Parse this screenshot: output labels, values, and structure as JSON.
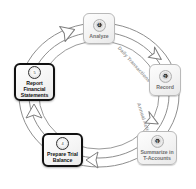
{
  "diagram": {
    "title_faint": "",
    "type": "accounting-cycle",
    "background": "#ffffff",
    "nodes": [
      {
        "id": "analyze",
        "step": "1",
        "label": "Analyze",
        "emphasis": false,
        "badge_icon": "numbered-disc-icon"
      },
      {
        "id": "record",
        "step": "2",
        "label": "Record",
        "emphasis": false,
        "badge_icon": "numbered-disc-icon"
      },
      {
        "id": "summarize",
        "step": "3",
        "label": "Summarize in T-Accounts",
        "emphasis": false,
        "badge_icon": "numbered-disc-icon"
      },
      {
        "id": "trial-balance",
        "step": "4",
        "label": "Prepare Trial Balance",
        "emphasis": true,
        "badge_icon": "numbered-disc-icon"
      },
      {
        "id": "report",
        "step": "5",
        "label": "Report Financial Statements",
        "emphasis": true,
        "badge_icon": "numbered-disc-icon"
      }
    ],
    "arc_labels": [
      {
        "id": "daily",
        "text": "Daily Transactions"
      },
      {
        "id": "annual",
        "text": "Annual Actions"
      }
    ],
    "arrows": [
      {
        "id": "to-analyze",
        "direction": "right",
        "icon": "hollow-arrow-icon"
      },
      {
        "id": "to-record",
        "direction": "down-right",
        "icon": "hollow-arrow-icon"
      },
      {
        "id": "to-summarize",
        "direction": "down",
        "icon": "hollow-arrow-icon"
      },
      {
        "id": "to-trial-balance",
        "direction": "left",
        "icon": "hollow-arrow-icon"
      },
      {
        "id": "to-report",
        "direction": "up",
        "icon": "hollow-arrow-icon"
      }
    ],
    "colors": {
      "ring_stroke": "#8e8e8e",
      "node_border": "#b9b9b9",
      "node_border_emphasis": "#111111",
      "label_text": "#6f6f6f",
      "label_text_emphasis": "#111111",
      "arc_label_text": "#9a9a9a"
    }
  }
}
